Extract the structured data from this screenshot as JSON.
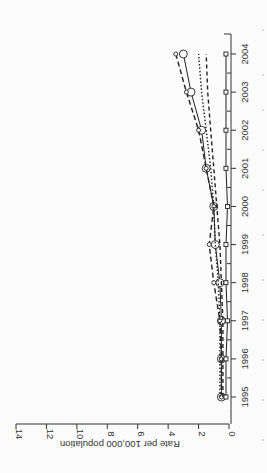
{
  "chart_data": {
    "type": "line",
    "orientation": "rotated-90-ccw",
    "title": "",
    "xlabel": "",
    "ylabel": "Rate per 100,000 population",
    "x": [
      1995,
      1996,
      1997,
      1998,
      1999,
      2000,
      2001,
      2002,
      2003,
      2004
    ],
    "x_tick_labels": [
      "1995",
      "1996",
      "1997",
      "1998",
      "1999",
      "2000",
      "2001",
      "2002",
      "2003",
      "2004"
    ],
    "y_tick_labels": [
      "0",
      "2",
      "4",
      "6",
      "8",
      "10",
      "12",
      "14"
    ],
    "y_ticks": [
      0,
      2,
      4,
      6,
      8,
      10,
      12,
      14
    ],
    "ylim": [
      0,
      14
    ],
    "xlim": [
      1994.7,
      2004.3
    ],
    "grid": false,
    "legend": null,
    "series": [
      {
        "name": "series-1 (solid, large circles)",
        "style": "solid",
        "marker": "circle-large",
        "values": [
          0.5,
          0.5,
          0.5,
          0.6,
          0.9,
          1.0,
          1.5,
          1.8,
          2.5,
          3.0
        ]
      },
      {
        "name": "series-2 (long dash, small circles)",
        "style": "longdash",
        "marker": "circle-small",
        "values": [
          0.5,
          0.5,
          0.6,
          1.0,
          1.3,
          1.0,
          1.5,
          2.0,
          2.8,
          3.5
        ]
      },
      {
        "name": "series-3 (dotted)",
        "style": "dotted",
        "marker": "none",
        "values": [
          0.6,
          0.6,
          0.6,
          0.7,
          0.9,
          1.0,
          1.2,
          1.5,
          1.8,
          2.0
        ]
      },
      {
        "name": "series-4 (dashed)",
        "style": "dashed",
        "marker": "none",
        "values": [
          0.4,
          0.4,
          0.4,
          0.5,
          0.6,
          0.8,
          1.0,
          1.2,
          1.4,
          1.5
        ]
      },
      {
        "name": "series-5 (solid, squares)",
        "style": "solid",
        "marker": "square",
        "values": [
          0.2,
          0.2,
          0.1,
          0.2,
          0.2,
          0.1,
          0.2,
          0.2,
          0.2,
          0.2
        ]
      }
    ]
  },
  "colors": {
    "line": "#222222",
    "axis": "#333333",
    "background": "#fbfbfb"
  }
}
